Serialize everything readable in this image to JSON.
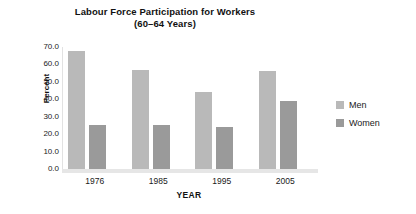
{
  "chart_data": {
    "type": "bar",
    "title": "Labour Force Participation for Workers",
    "subtitle": "(60–64 Years)",
    "xlabel": "YEAR",
    "ylabel": "Percent",
    "categories": [
      "1976",
      "1985",
      "1995",
      "2005"
    ],
    "ytick_labels": [
      "0.0",
      "10.0",
      "20.0",
      "30.0",
      "40.0",
      "50.0",
      "60.0",
      "70.0"
    ],
    "ytick_values": [
      0,
      10,
      20,
      30,
      40,
      50,
      60,
      70
    ],
    "ylim": [
      0,
      70
    ],
    "grid": false,
    "legend_position": "right",
    "series": [
      {
        "name": "Men",
        "color": "#b9b9b9",
        "values": [
          68.0,
          57.0,
          44.0,
          56.0
        ]
      },
      {
        "name": "Women",
        "color": "#9a9a9a",
        "values": [
          25.0,
          25.0,
          24.0,
          39.0
        ]
      }
    ]
  },
  "colors": {
    "background": "#ffffff",
    "men": "#b9b9b9",
    "women": "#9a9a9a",
    "axis": "#e2e2e2",
    "baseline": "#e6e6e6",
    "text": "#1a1a1a"
  }
}
